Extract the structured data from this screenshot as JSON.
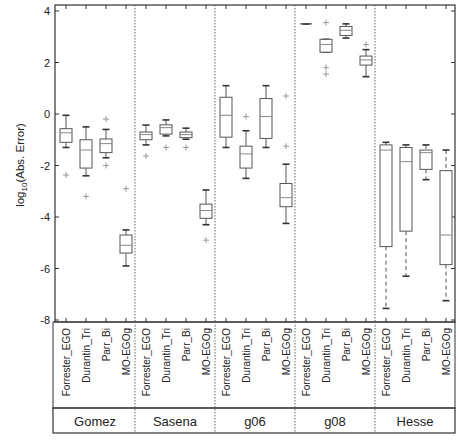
{
  "chart_data": {
    "type": "box",
    "title": "",
    "ylabel": "log10(Abs. Error)",
    "ylabel_base": "log",
    "ylabel_sub": "10",
    "ylabel_rest": "(Abs. Error)",
    "ylim": [
      -8,
      4
    ],
    "yticks": [
      4,
      2,
      0,
      -2,
      -4,
      -6,
      -8
    ],
    "grid": false,
    "methods": [
      "Forrester_EGO",
      "Durantin_Tri",
      "Parr_Bi",
      "MO-EGOg"
    ],
    "groups": [
      {
        "name": "Gomez",
        "boxes": [
          {
            "method": "Forrester_EGO",
            "whisker_low": -1.3,
            "q1": -1.1,
            "median": -0.73,
            "q3": -0.57,
            "whisker_high": -0.05,
            "outliers": [
              -2.37
            ]
          },
          {
            "method": "Durantin_Tri",
            "whisker_low": -2.4,
            "q1": -2.1,
            "median": -1.4,
            "q3": -1.0,
            "whisker_high": -0.5,
            "outliers": [
              -3.2
            ]
          },
          {
            "method": "Parr_Bi",
            "whisker_low": -1.7,
            "q1": -1.5,
            "median": -1.15,
            "q3": -0.97,
            "whisker_high": -0.6,
            "outliers": [
              -0.2,
              -2.0
            ]
          },
          {
            "method": "MO-EGOg",
            "whisker_low": -5.9,
            "q1": -5.4,
            "median": -5.1,
            "q3": -4.7,
            "whisker_high": -4.5,
            "outliers": [
              -2.9
            ]
          }
        ]
      },
      {
        "name": "Sasena",
        "boxes": [
          {
            "method": "Forrester_EGO",
            "whisker_low": -1.2,
            "q1": -1.0,
            "median": -0.8,
            "q3": -0.7,
            "whisker_high": -0.43,
            "outliers": [
              -1.63
            ]
          },
          {
            "method": "Durantin_Tri",
            "whisker_low": -0.85,
            "q1": -0.78,
            "median": -0.53,
            "q3": -0.42,
            "whisker_high": -0.23,
            "outliers": [
              -1.3
            ]
          },
          {
            "method": "Parr_Bi",
            "whisker_low": -0.98,
            "q1": -0.92,
            "median": -0.8,
            "q3": -0.7,
            "whisker_high": -0.55,
            "outliers": [
              -1.3
            ]
          },
          {
            "method": "MO-EGOg",
            "whisker_low": -4.3,
            "q1": -4.05,
            "median": -3.75,
            "q3": -3.5,
            "whisker_high": -2.95,
            "outliers": [
              -4.9
            ]
          }
        ]
      },
      {
        "name": "g06",
        "boxes": [
          {
            "method": "Forrester_EGO",
            "whisker_low": -1.3,
            "q1": -0.9,
            "median": -0.05,
            "q3": 0.65,
            "whisker_high": 1.1,
            "outliers": []
          },
          {
            "method": "Durantin_Tri",
            "whisker_low": -2.5,
            "q1": -2.1,
            "median": -1.55,
            "q3": -1.25,
            "whisker_high": -0.65,
            "outliers": [
              -0.1
            ]
          },
          {
            "method": "Parr_Bi",
            "whisker_low": -1.3,
            "q1": -0.95,
            "median": -0.1,
            "q3": 0.6,
            "whisker_high": 1.1,
            "outliers": []
          },
          {
            "method": "MO-EGOg",
            "whisker_low": -4.25,
            "q1": -3.6,
            "median": -3.25,
            "q3": -2.7,
            "whisker_high": -1.95,
            "outliers": [
              0.7,
              -1.25
            ]
          }
        ]
      },
      {
        "name": "g08",
        "boxes": [
          {
            "method": "Forrester_EGO",
            "whisker_low": 3.5,
            "q1": 3.5,
            "median": 3.5,
            "q3": 3.5,
            "whisker_high": 3.5,
            "outliers": []
          },
          {
            "method": "Durantin_Tri",
            "whisker_low": 2.4,
            "q1": 2.4,
            "median": 2.7,
            "q3": 2.9,
            "whisker_high": 2.9,
            "outliers": [
              3.55,
              1.8,
              1.55
            ]
          },
          {
            "method": "Parr_Bi",
            "whisker_low": 2.95,
            "q1": 3.05,
            "median": 3.25,
            "q3": 3.4,
            "whisker_high": 3.5,
            "outliers": []
          },
          {
            "method": "MO-EGOg",
            "whisker_low": 1.45,
            "q1": 1.9,
            "median": 2.1,
            "q3": 2.25,
            "whisker_high": 2.5,
            "outliers": [
              2.7
            ]
          }
        ]
      },
      {
        "name": "Hesse",
        "boxes": [
          {
            "method": "Forrester_EGO",
            "whisker_low": -7.55,
            "q1": -5.15,
            "median": -1.4,
            "q3": -1.2,
            "whisker_high": -1.1,
            "outliers": []
          },
          {
            "method": "Durantin_Tri",
            "whisker_low": -6.3,
            "q1": -4.55,
            "median": -1.85,
            "q3": -1.3,
            "whisker_high": -1.2,
            "outliers": []
          },
          {
            "method": "Parr_Bi",
            "whisker_low": -2.55,
            "q1": -2.15,
            "median": -1.5,
            "q3": -1.4,
            "whisker_high": -1.2,
            "outliers": []
          },
          {
            "method": "MO-EGOg",
            "whisker_low": -7.25,
            "q1": -5.85,
            "median": -4.7,
            "q3": -2.2,
            "whisker_high": -1.4,
            "outliers": []
          }
        ]
      }
    ],
    "colors": {
      "axis": "#333333",
      "box": "#555555",
      "median": "#888888",
      "outlier": "#999999",
      "divider": "#666666"
    }
  }
}
